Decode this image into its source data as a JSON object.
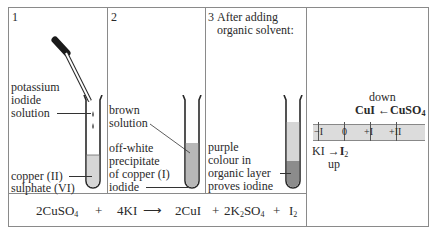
{
  "panels": [
    {
      "number": "1",
      "labels": {
        "dropper_line1": "potassium",
        "dropper_line2": "iodide",
        "dropper_line3": "solution",
        "tube_line1": "copper (II)",
        "tube_line2": "sulphate (VI)"
      }
    },
    {
      "number": "2",
      "labels": {
        "solution_line1": "brown",
        "solution_line2": "solution",
        "precip_line1": "off-white",
        "precip_line2": "precipitate",
        "precip_line3": "of copper (I)",
        "precip_line4": "iodide"
      }
    },
    {
      "number": "3",
      "title_line1": "After adding",
      "title_line2": "organic solvent:",
      "labels": {
        "line1": "purple",
        "line2": "colour in",
        "line3": "organic layer",
        "line4": "proves iodine"
      }
    }
  ],
  "oxidation_diagram": {
    "down_label": "down",
    "down_from": "CuSO",
    "down_from_sub": "4",
    "down_to": "CuI",
    "up_label": "up",
    "up_from": "KI",
    "up_to": "I",
    "up_to_sub": "2",
    "scale_ticks": [
      "−I",
      "0",
      "+I",
      "+II"
    ]
  },
  "equation": {
    "reactant1": "2CuSO",
    "reactant1_sub": "4",
    "plus1": "+",
    "reactant2": "4KI",
    "product1": "2CuI",
    "plus2": "+",
    "product2_a": "2K",
    "product2_sub1": "2",
    "product2_b": "SO",
    "product2_sub2": "4",
    "plus3": "+",
    "product3": "I",
    "product3_sub": "2"
  },
  "colors": {
    "border": "#8a8a8a",
    "liquid": "#d6d6d6",
    "dark_liquid": "#8c8c8c",
    "scale_fill": "#dcdcdc"
  }
}
